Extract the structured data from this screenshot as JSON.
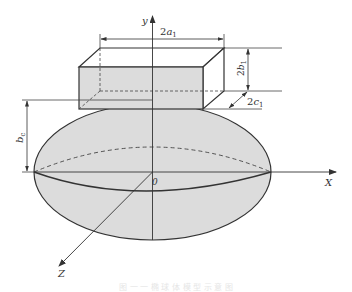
{
  "figure": {
    "axes": {
      "x": "X",
      "y": "y",
      "z": "Z",
      "origin": "0"
    },
    "dimensions": {
      "width": {
        "prefix": "2",
        "var": "a",
        "sub": "1"
      },
      "height": {
        "prefix": "2",
        "var": "b",
        "sub": "1"
      },
      "depth": {
        "prefix": "2",
        "var": "c",
        "sub": "1"
      },
      "ellipsoid_semi_axis": {
        "var": "b",
        "sub": "c"
      }
    },
    "caption": "图 一 一 椭 球 体 模 型 示 意 图"
  },
  "colors": {
    "line": "#333333",
    "fill": "#d9d9d9",
    "background": "#ffffff"
  }
}
